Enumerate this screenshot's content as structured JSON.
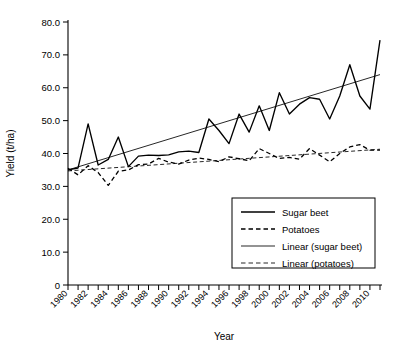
{
  "chart_data": {
    "type": "line",
    "title": "",
    "xlabel": "Year",
    "ylabel": "Yield (t/ha)",
    "xlim": [
      1980,
      2011
    ],
    "ylim": [
      0,
      80
    ],
    "ytick_labels": [
      "80.0",
      "70.0",
      "60.0",
      "50.0",
      "40.0",
      "30.0",
      "20.0",
      "10.0",
      "0"
    ],
    "ytick_values": [
      80,
      70,
      60,
      50,
      40,
      30,
      20,
      10,
      0
    ],
    "xtick_labels": [
      "1980",
      "1982",
      "1984",
      "1986",
      "1988",
      "1990",
      "1992",
      "1994",
      "1996",
      "1998",
      "2000",
      "2002",
      "2004",
      "2006",
      "2008",
      "2010"
    ],
    "xtick_values": [
      1980,
      1982,
      1984,
      1986,
      1988,
      1990,
      1992,
      1994,
      1996,
      1998,
      2000,
      2002,
      2004,
      2006,
      2008,
      2010
    ],
    "xtick_label_rotation": 45,
    "minor_ticks_every": 1,
    "grid": false,
    "legend_position": "lower-right",
    "x": [
      1980,
      1981,
      1982,
      1983,
      1984,
      1985,
      1986,
      1987,
      1988,
      1989,
      1990,
      1991,
      1992,
      1993,
      1994,
      1995,
      1996,
      1997,
      1998,
      1999,
      2000,
      2001,
      2002,
      2003,
      2004,
      2005,
      2006,
      2007,
      2008,
      2009,
      2010,
      2011
    ],
    "series": [
      {
        "name": "Sugar beet",
        "style": "solid",
        "values": [
          35.0,
          35.6,
          49.0,
          36.5,
          38.2,
          45.0,
          36.0,
          39.2,
          39.5,
          39.4,
          39.6,
          40.5,
          40.7,
          40.3,
          50.5,
          47.0,
          43.0,
          52.0,
          46.5,
          54.5,
          47.0,
          58.5,
          52.0,
          55.0,
          57.0,
          56.5,
          50.5,
          57.5,
          67.0,
          57.5,
          53.5,
          74.5
        ]
      },
      {
        "name": "Potatoes",
        "style": "dashed",
        "values": [
          35.5,
          33.5,
          36.3,
          34.2,
          30.3,
          34.6,
          35.0,
          36.6,
          36.8,
          38.5,
          37.4,
          36.8,
          38.0,
          38.6,
          38.2,
          37.5,
          39.0,
          38.4,
          37.8,
          41.5,
          40.0,
          38.5,
          38.8,
          38.3,
          41.5,
          39.5,
          37.5,
          40.0,
          42.0,
          42.7,
          41.0,
          41.0
        ]
      }
    ],
    "trendlines": [
      {
        "name": "Linear (sugar beet)",
        "style": "solid",
        "x_start": 1980,
        "y_start": 35.0,
        "x_end": 2011,
        "y_end": 64.0
      },
      {
        "name": "Linear (potatoes)",
        "style": "dashed",
        "x_start": 1980,
        "y_start": 34.7,
        "x_end": 2011,
        "y_end": 41.3
      }
    ],
    "legend": [
      {
        "label": "Sugar beet",
        "style": "solid",
        "weight": "thick"
      },
      {
        "label": "Potatoes",
        "style": "dashed",
        "weight": "thick"
      },
      {
        "label": "Linear (sugar beet)",
        "style": "solid",
        "weight": "thin"
      },
      {
        "label": "Linear (potatoes)",
        "style": "dashed",
        "weight": "thin"
      }
    ]
  }
}
